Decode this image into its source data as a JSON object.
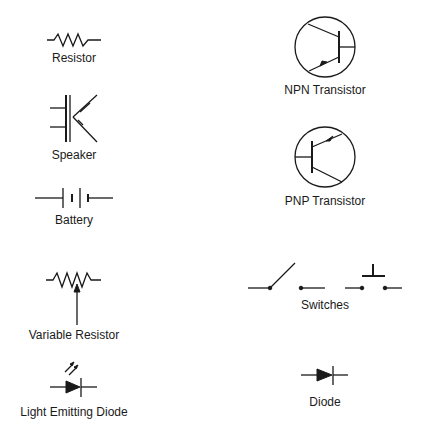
{
  "symbols": [
    {
      "id": "resistor",
      "label": "Resistor"
    },
    {
      "id": "speaker",
      "label": "Speaker"
    },
    {
      "id": "battery",
      "label": "Battery"
    },
    {
      "id": "variable-resistor",
      "label": "Variable Resistor"
    },
    {
      "id": "led",
      "label": "Light Emitting Diode"
    },
    {
      "id": "npn-transistor",
      "label": "NPN Transistor"
    },
    {
      "id": "pnp-transistor",
      "label": "PNP Transistor"
    },
    {
      "id": "switches",
      "label": "Switches"
    },
    {
      "id": "diode",
      "label": "Diode"
    }
  ],
  "colors": {
    "ink": "#1a1a1a",
    "background": "#ffffff"
  }
}
